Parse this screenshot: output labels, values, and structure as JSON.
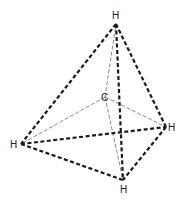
{
  "diagram": {
    "type": "tetrahedral-molecule",
    "molecule": "CH4",
    "atoms": {
      "center": {
        "label": "C",
        "x": 105,
        "y": 97,
        "label_x": 101,
        "label_y": 101
      },
      "top": {
        "label": "H",
        "x": 116,
        "y": 24,
        "label_x": 112,
        "label_y": 19
      },
      "left": {
        "label": "H",
        "x": 21,
        "y": 144,
        "label_x": 10,
        "label_y": 148
      },
      "right": {
        "label": "H",
        "x": 166,
        "y": 127,
        "label_x": 168,
        "label_y": 131
      },
      "bottom": {
        "label": "H",
        "x": 123,
        "y": 180,
        "label_x": 120,
        "label_y": 193
      }
    },
    "tetrahedron_edges": [
      [
        "top",
        "left"
      ],
      [
        "top",
        "right"
      ],
      [
        "top",
        "bottom"
      ],
      [
        "left",
        "right"
      ],
      [
        "left",
        "bottom"
      ],
      [
        "right",
        "bottom"
      ]
    ],
    "bonds": [
      [
        "center",
        "top"
      ],
      [
        "center",
        "left"
      ],
      [
        "center",
        "right"
      ],
      [
        "center",
        "bottom"
      ]
    ],
    "colors": {
      "edge": "#1a1a1a",
      "bond": "#555555",
      "label": "#222222",
      "background": "#ffffff"
    }
  }
}
